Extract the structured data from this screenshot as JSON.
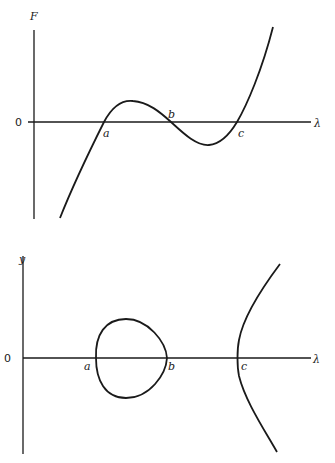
{
  "diagram": {
    "top_plot": {
      "y_axis_label": "F",
      "x_axis_label": "λ",
      "origin_label": "0",
      "roots": [
        "a",
        "b",
        "c"
      ],
      "description": "Cubic F(λ) with three real roots a < b < c"
    },
    "bottom_plot": {
      "y_axis_label": "y",
      "x_axis_label": "λ",
      "origin_label": "0",
      "roots": [
        "a",
        "b",
        "c"
      ],
      "description": "Curve y² = F(λ): closed oval between a and b, open branch from c"
    }
  },
  "colors": {
    "ink": "#1a1a1a",
    "background": "#ffffff"
  }
}
